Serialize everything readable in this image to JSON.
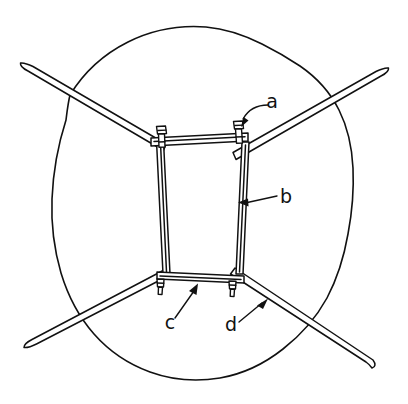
{
  "figure": {
    "title": "",
    "kind": "line-drawing",
    "background_color": "#ffffff",
    "stroke_color": "#111111",
    "width": 408,
    "height": 404
  },
  "labels": [
    {
      "id": "a",
      "text": "a",
      "x": 272,
      "y": 108,
      "points_to": "corner-bolt-assembly-top-right"
    },
    {
      "id": "b",
      "text": "b",
      "x": 281,
      "y": 203,
      "points_to": "vertical-frame-bar-right"
    },
    {
      "id": "c",
      "text": "c",
      "x": 170,
      "y": 329,
      "points_to": "horizontal-frame-bar-bottom"
    },
    {
      "id": "d",
      "text": "d",
      "x": 228,
      "y": 331,
      "points_to": "diagonal-rod-lower-right"
    }
  ],
  "parts": {
    "outline": "hand-drawn-circular-blob-outline",
    "frame": "rectangular-frame-four-bars",
    "bolts": "four-corner-bolt-nut-assemblies",
    "rods": "four-tapered-diagonal-rods-crossing"
  }
}
